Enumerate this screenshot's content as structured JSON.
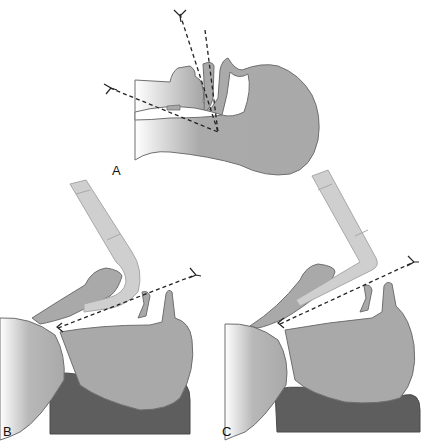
{
  "figure": {
    "type": "anatomical-diagram",
    "panels": [
      {
        "id": "A",
        "label": "A",
        "view": "head in neutral position with oral, pharyngeal and laryngeal axes shown as dashed lines converging"
      },
      {
        "id": "B",
        "label": "B",
        "view": "head elevated on pillow with laryngoscope (curved blade) inserted; line of sight dashed"
      },
      {
        "id": "C",
        "label": "C",
        "view": "head elevated on pillow with laryngoscope (straight blade) inserted; line of sight dashed"
      }
    ]
  },
  "colors": {
    "tissue": "#a9a9a9",
    "tissue_outline": "#6f6f6f",
    "pillow": "#5e5e5e",
    "laryngoscope": "#cfcfcf",
    "laryngoscope_outline": "#a8a8a8",
    "axis_line": "#222222",
    "background": "#ffffff"
  }
}
